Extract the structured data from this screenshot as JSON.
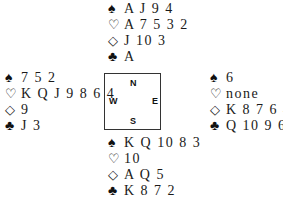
{
  "diagram": {
    "type": "bridge-deal",
    "suit_symbols": {
      "spades": "♠",
      "hearts": "♡",
      "diamonds": "◇",
      "clubs": "♣"
    },
    "compass": {
      "north": "N",
      "south": "S",
      "east": "E",
      "west": "W"
    },
    "hands": {
      "north": {
        "spades": "A J 9 4",
        "hearts": "A 7 5 3 2",
        "diamonds": "J 10 3",
        "clubs": "A"
      },
      "west": {
        "spades": "7 5 2",
        "hearts": "K Q J 9 8 6 4",
        "diamonds": "9",
        "clubs": "J 3"
      },
      "east": {
        "spades": "6",
        "hearts": "none",
        "diamonds": "K 8 7 6 4 2",
        "clubs": "Q 10 9 6 5 4"
      },
      "south": {
        "spades": "K Q 10 8 3",
        "hearts": "10",
        "diamonds": "A Q 5",
        "clubs": "K 8 7 2"
      }
    }
  }
}
